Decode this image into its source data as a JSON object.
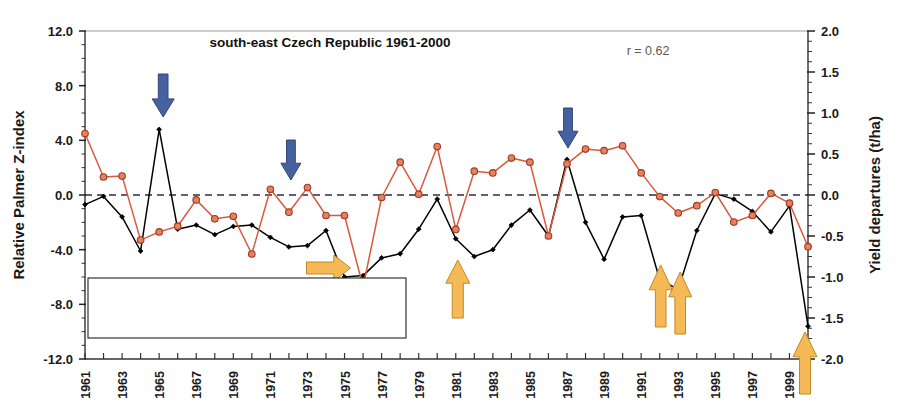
{
  "chart_data": {
    "type": "line",
    "title": "south-east Czech Republic 1961-2000",
    "annotation_r": "r = 0.62",
    "xlabel": "",
    "ylabel": "Relative Palmer Z-index",
    "y2label": "Yield departures (t/ha)",
    "ylim": [
      -12.0,
      12.0
    ],
    "y2lim": [
      -2.0,
      2.0
    ],
    "yticks": [
      "12.0",
      "8.0",
      "4.0",
      "0.0",
      "-4.0",
      "-8.0",
      "-12.0"
    ],
    "y2ticks": [
      "2.0",
      "1.5",
      "1.0",
      "0.5",
      "0.0",
      "-0.5",
      "-1.0",
      "-1.5",
      "-2.0"
    ],
    "grid": false,
    "zero_line": true,
    "legend_position": "bottom-left",
    "x": [
      1961,
      1962,
      1963,
      1964,
      1965,
      1966,
      1967,
      1968,
      1969,
      1970,
      1971,
      1972,
      1973,
      1974,
      1975,
      1976,
      1977,
      1978,
      1979,
      1980,
      1981,
      1982,
      1983,
      1984,
      1985,
      1986,
      1987,
      1988,
      1989,
      1990,
      1991,
      1992,
      1993,
      1994,
      1995,
      1996,
      1997,
      1998,
      1999,
      2000
    ],
    "xticklabels": [
      "1961",
      "1963",
      "1965",
      "1967",
      "1969",
      "1971",
      "1973",
      "1975",
      "1977",
      "1979",
      "1981",
      "1983",
      "1985",
      "1987",
      "1989",
      "1991",
      "1993",
      "1995",
      "1997",
      "1999"
    ],
    "series": [
      {
        "name": "Relative Palmer Z-index",
        "axis": "left",
        "color": "#000000",
        "marker": "diamond",
        "values": [
          -0.7,
          -0.1,
          -1.6,
          -4.1,
          4.8,
          -2.5,
          -2.2,
          -2.9,
          -2.3,
          -2.2,
          -3.1,
          -3.8,
          -3.7,
          -2.6,
          -6.0,
          -5.9,
          -4.6,
          -4.3,
          -2.5,
          -0.3,
          -3.2,
          -4.5,
          -4.0,
          -2.2,
          -1.1,
          -3.0,
          2.6,
          -2.0,
          -4.7,
          -1.6,
          -1.5,
          -6.2,
          -6.9,
          -2.6,
          0.1,
          -0.3,
          -1.2,
          -2.7,
          -0.8,
          -9.6
        ]
      },
      {
        "name": "Detrended yield departures of spring barley",
        "axis": "right",
        "color": "#d9593c",
        "marker": "circle",
        "values": [
          0.75,
          0.22,
          0.23,
          -0.55,
          -0.45,
          -0.38,
          -0.06,
          -0.29,
          -0.26,
          -0.72,
          0.07,
          -0.21,
          0.09,
          -0.25,
          -0.25,
          -1.12,
          -0.03,
          0.4,
          0.01,
          0.59,
          -0.42,
          0.29,
          0.27,
          0.45,
          0.4,
          -0.5,
          0.38,
          0.56,
          0.54,
          0.6,
          0.27,
          -0.02,
          -0.22,
          -0.13,
          0.03,
          -0.33,
          -0.25,
          0.02,
          -0.1,
          -0.63
        ]
      }
    ],
    "arrows_down_blue": [
      1965,
      1972,
      1987
    ],
    "arrows_up_orange": [
      1981,
      1992,
      1993,
      2000
    ],
    "arrow_right_orange": [
      1975
    ],
    "arrow_blue_color": "#46629e",
    "arrow_orange_color": "#f5ba57"
  },
  "legend": {
    "items": [
      {
        "label": "Relative Palmer Z-index"
      },
      {
        "label": "Detrended yield departures of spring barley"
      }
    ]
  }
}
